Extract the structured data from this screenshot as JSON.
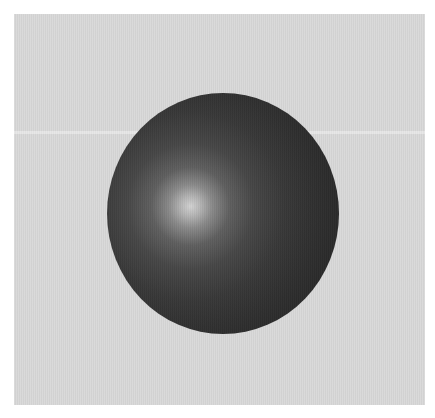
{
  "scene": {
    "description": "Grayscale rendered shaded sphere on a light gray square backdrop",
    "background_color": "#ffffff",
    "panel": {
      "color": "#d8d8d8"
    },
    "sphere": {
      "base_color": "#2a2a2a",
      "highlight_color": "#d2d2d2",
      "shading": "radial specular highlight, upper-left of center"
    }
  }
}
